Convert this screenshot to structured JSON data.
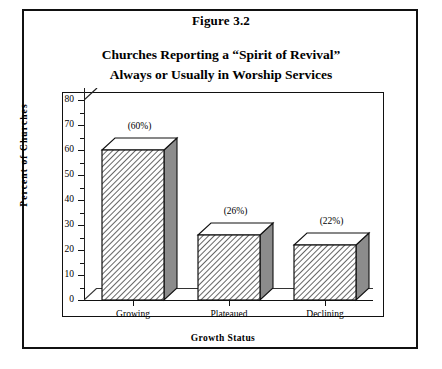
{
  "figure": {
    "number_label": "Figure 3.2",
    "title_line1": "Churches Reporting a “Spirit of Revival”",
    "title_line2": "Always or Usually in Worship Services"
  },
  "chart_data": {
    "type": "bar",
    "title": "Churches Reporting a “Spirit of Revival” Always or Usually in Worship Services",
    "subtitle": "Figure 3.2",
    "categories": [
      "Growing",
      "Plateaued",
      "Declining"
    ],
    "values": [
      60,
      26,
      22
    ],
    "data_labels": [
      "(60%)",
      "(26%)",
      "(22%)"
    ],
    "xlabel": "Growth Status",
    "ylabel": "Percent  of  Churches",
    "ylim": [
      0,
      80
    ],
    "ytick_step": 10,
    "yminor_step": 5,
    "ytick_labels": [
      "0",
      "10",
      "20",
      "30",
      "40",
      "50",
      "60",
      "70",
      "80"
    ],
    "grid": false,
    "legend": false,
    "style": "3d-bar-hatched",
    "bar_fill": "diagonal-hatch",
    "colors": {
      "line": "#111111",
      "bar_face": "#ffffff",
      "bar_hatch": "#4a4a4a",
      "bar_side": "#8c8c8c",
      "bar_top": "#ffffff",
      "background": "#ffffff"
    }
  }
}
